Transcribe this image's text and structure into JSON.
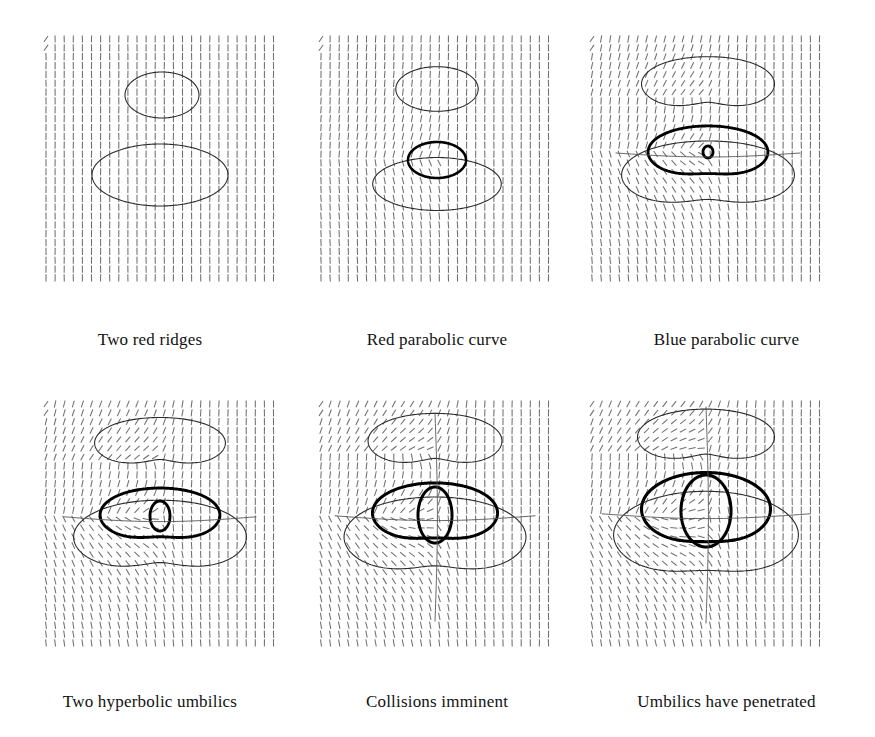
{
  "figure": {
    "background_color": "#ffffff",
    "ink_color": "#1a1a1a",
    "field_color": "#6f6f6f",
    "rows": 2,
    "cols": 3
  },
  "panels": [
    {
      "id": "panel-1",
      "caption": "Two red ridges",
      "row": 0,
      "col": 0,
      "field": {
        "type": "line-field",
        "nx": 26,
        "ny": 28,
        "dx": 9.1,
        "dy": 8.85,
        "x0": 6,
        "y0": 7,
        "tick_length": 7.2,
        "base_angle_deg": 90,
        "swirl_strength": 0.0,
        "centers": [],
        "corner_tilt_deg": 35
      },
      "curves": [
        {
          "name": "upper-red-ridge",
          "kind": "ellipse",
          "cx": 122,
          "cy": 63,
          "rx": 37,
          "ry": 23,
          "stroke": "#2b2b2b",
          "width": 1.1,
          "wobble": 0.0,
          "lobes": 0
        },
        {
          "name": "lower-red-ridge",
          "kind": "ellipse",
          "cx": 120,
          "cy": 143,
          "rx": 68,
          "ry": 31,
          "stroke": "#2b2b2b",
          "width": 1.1,
          "wobble": 0.0,
          "lobes": 0
        }
      ]
    },
    {
      "id": "panel-2",
      "caption": "Red parabolic curve",
      "row": 0,
      "col": 1,
      "field": {
        "type": "line-field",
        "nx": 26,
        "ny": 28,
        "dx": 9.1,
        "dy": 8.85,
        "x0": 6,
        "y0": 7,
        "tick_length": 7.2,
        "base_angle_deg": 90,
        "swirl_strength": 0.3,
        "centers": [
          {
            "x": 125,
            "y": 130,
            "weight": 1.0
          }
        ],
        "corner_tilt_deg": 35
      },
      "curves": [
        {
          "name": "upper-red-ridge",
          "kind": "ellipse",
          "cx": 122,
          "cy": 57,
          "rx": 40,
          "ry": 23,
          "stroke": "#2b2b2b",
          "width": 1.1,
          "wobble": 0.03,
          "lobes": 2
        },
        {
          "name": "lower-red-ridge",
          "kind": "ellipse",
          "cx": 122,
          "cy": 152,
          "rx": 63,
          "ry": 27,
          "stroke": "#2b2b2b",
          "width": 1.1,
          "wobble": 0.02,
          "lobes": 2
        },
        {
          "name": "blue-parabolic-curve",
          "kind": "ellipse",
          "cx": 122,
          "cy": 128,
          "rx": 29,
          "ry": 18,
          "stroke": "#000000",
          "width": 2.6,
          "wobble": 0.0,
          "lobes": 0
        }
      ]
    },
    {
      "id": "panel-3",
      "caption": "Blue parabolic curve",
      "row": 0,
      "col": 2,
      "field": {
        "type": "line-field",
        "nx": 26,
        "ny": 28,
        "dx": 9.1,
        "dy": 8.85,
        "x0": 6,
        "y0": 7,
        "tick_length": 7.2,
        "base_angle_deg": 90,
        "swirl_strength": 0.72,
        "centers": [
          {
            "x": 124,
            "y": 122,
            "weight": 1.0
          },
          {
            "x": 124,
            "y": 62,
            "weight": 0.45
          }
        ],
        "corner_tilt_deg": 35
      },
      "curves": [
        {
          "name": "upper-red-ridge",
          "kind": "blob",
          "cx": 122,
          "cy": 52,
          "rx": 61,
          "ry": 30,
          "stroke": "#2b2b2b",
          "width": 1.1,
          "wobble": 0.09,
          "lobes": 2,
          "notch": 0.3
        },
        {
          "name": "lower-red-ridge",
          "kind": "blob",
          "cx": 122,
          "cy": 143,
          "rx": 80,
          "ry": 37,
          "stroke": "#2b2b2b",
          "width": 1.1,
          "wobble": 0.08,
          "lobes": 2,
          "notch": 0.26
        },
        {
          "name": "blue-parabolic-curve",
          "kind": "blob",
          "cx": 122,
          "cy": 120,
          "rx": 56,
          "ry": 28,
          "stroke": "#000000",
          "width": 2.8,
          "wobble": 0.07,
          "lobes": 2,
          "notch": 0.16
        },
        {
          "name": "umbilic-pair",
          "kind": "ellipse",
          "cx": 122,
          "cy": 120,
          "rx": 5,
          "ry": 6,
          "stroke": "#000000",
          "width": 2.8,
          "wobble": 0.0,
          "lobes": 0
        },
        {
          "name": "horizontal-separatrix",
          "kind": "hline",
          "cx": 122,
          "cy": 122,
          "rx": 92,
          "ry": 5,
          "stroke": "#555555",
          "width": 0.9
        }
      ]
    },
    {
      "id": "panel-4",
      "caption": "Two hyperbolic umbilics",
      "row": 1,
      "col": 0,
      "field": {
        "type": "line-field",
        "nx": 26,
        "ny": 28,
        "dx": 9.1,
        "dy": 8.85,
        "x0": 6,
        "y0": 7,
        "tick_length": 7.2,
        "base_angle_deg": 90,
        "swirl_strength": 0.95,
        "centers": [
          {
            "x": 122,
            "y": 122,
            "weight": 1.0
          },
          {
            "x": 122,
            "y": 62,
            "weight": 0.5
          }
        ],
        "corner_tilt_deg": 35
      },
      "curves": [
        {
          "name": "upper-red-ridge",
          "kind": "blob",
          "cx": 120,
          "cy": 46,
          "rx": 60,
          "ry": 28,
          "stroke": "#2b2b2b",
          "width": 1.1,
          "wobble": 0.09,
          "lobes": 2,
          "notch": 0.32
        },
        {
          "name": "lower-red-ridge",
          "kind": "blob",
          "cx": 120,
          "cy": 140,
          "rx": 80,
          "ry": 40,
          "stroke": "#2b2b2b",
          "width": 1.1,
          "wobble": 0.08,
          "lobes": 2,
          "notch": 0.28
        },
        {
          "name": "blue-parabolic-curve",
          "kind": "blob",
          "cx": 120,
          "cy": 118,
          "rx": 56,
          "ry": 29,
          "stroke": "#000000",
          "width": 2.9,
          "wobble": 0.07,
          "lobes": 2,
          "notch": 0.18
        },
        {
          "name": "umbilic-pair",
          "kind": "ellipse",
          "cx": 120,
          "cy": 119,
          "rx": 10,
          "ry": 15,
          "stroke": "#000000",
          "width": 2.9,
          "wobble": 0.0,
          "lobes": 0
        },
        {
          "name": "horizontal-separatrix",
          "kind": "hline",
          "cx": 120,
          "cy": 121,
          "rx": 96,
          "ry": 6,
          "stroke": "#555555",
          "width": 0.9
        }
      ]
    },
    {
      "id": "panel-5",
      "caption": "Collisions imminent",
      "row": 1,
      "col": 1,
      "field": {
        "type": "line-field",
        "nx": 26,
        "ny": 28,
        "dx": 9.1,
        "dy": 8.85,
        "x0": 6,
        "y0": 7,
        "tick_length": 7.2,
        "base_angle_deg": 90,
        "swirl_strength": 1.12,
        "centers": [
          {
            "x": 122,
            "y": 122,
            "weight": 1.0
          },
          {
            "x": 122,
            "y": 56,
            "weight": 0.55
          }
        ],
        "corner_tilt_deg": 35
      },
      "curves": [
        {
          "name": "upper-red-ridge",
          "kind": "blob",
          "cx": 120,
          "cy": 44,
          "rx": 62,
          "ry": 30,
          "stroke": "#2b2b2b",
          "width": 1.1,
          "wobble": 0.08,
          "lobes": 2,
          "notch": 0.34
        },
        {
          "name": "lower-red-ridge",
          "kind": "blob",
          "cx": 120,
          "cy": 140,
          "rx": 85,
          "ry": 43,
          "stroke": "#2b2b2b",
          "width": 1.1,
          "wobble": 0.07,
          "lobes": 2,
          "notch": 0.26
        },
        {
          "name": "blue-parabolic-curve",
          "kind": "blob",
          "cx": 120,
          "cy": 116,
          "rx": 59,
          "ry": 32,
          "stroke": "#000000",
          "width": 3.0,
          "wobble": 0.06,
          "lobes": 2,
          "notch": 0.16
        },
        {
          "name": "umbilic-pair",
          "kind": "ellipse",
          "cx": 120,
          "cy": 118,
          "rx": 17,
          "ry": 28,
          "stroke": "#000000",
          "width": 3.0,
          "wobble": 0.0,
          "lobes": 0
        },
        {
          "name": "horizontal-separatrix",
          "kind": "hline",
          "cx": 120,
          "cy": 120,
          "rx": 100,
          "ry": 6,
          "stroke": "#555555",
          "width": 0.9
        },
        {
          "name": "vertical-separatrix",
          "kind": "vline",
          "cx": 120,
          "cy": 120,
          "rx": 6,
          "ry": 104,
          "stroke": "#555555",
          "width": 0.9
        }
      ]
    },
    {
      "id": "panel-6",
      "caption": "Umbilics have penetrated",
      "row": 1,
      "col": 2,
      "field": {
        "type": "line-field",
        "nx": 26,
        "ny": 28,
        "dx": 9.1,
        "dy": 8.85,
        "x0": 6,
        "y0": 7,
        "tick_length": 7.2,
        "base_angle_deg": 90,
        "swirl_strength": 1.3,
        "centers": [
          {
            "x": 122,
            "y": 122,
            "weight": 1.0
          },
          {
            "x": 122,
            "y": 52,
            "weight": 0.6
          }
        ],
        "corner_tilt_deg": 35
      },
      "curves": [
        {
          "name": "upper-red-ridge",
          "kind": "blob",
          "cx": 120,
          "cy": 40,
          "rx": 64,
          "ry": 30,
          "stroke": "#2b2b2b",
          "width": 1.1,
          "wobble": 0.07,
          "lobes": 2,
          "notch": 0.36
        },
        {
          "name": "lower-red-ridge",
          "kind": "blob",
          "cx": 120,
          "cy": 138,
          "rx": 88,
          "ry": 46,
          "stroke": "#2b2b2b",
          "width": 1.1,
          "wobble": 0.05,
          "lobes": 2,
          "notch": 0.18
        },
        {
          "name": "blue-parabolic-curve",
          "kind": "blob",
          "cx": 120,
          "cy": 112,
          "rx": 62,
          "ry": 38,
          "stroke": "#000000",
          "width": 3.1,
          "wobble": 0.04,
          "lobes": 2,
          "notch": 0.1
        },
        {
          "name": "umbilic-pair",
          "kind": "ellipse",
          "cx": 120,
          "cy": 114,
          "rx": 25,
          "ry": 36,
          "stroke": "#000000",
          "width": 3.1,
          "wobble": 0.0,
          "lobes": 0
        },
        {
          "name": "horizontal-separatrix",
          "kind": "hline",
          "cx": 120,
          "cy": 118,
          "rx": 104,
          "ry": 6,
          "stroke": "#555555",
          "width": 0.9
        },
        {
          "name": "vertical-separatrix",
          "kind": "vline",
          "cx": 120,
          "cy": 118,
          "rx": 6,
          "ry": 108,
          "stroke": "#555555",
          "width": 0.9
        }
      ]
    }
  ],
  "captions": {
    "row0": [
      "Two red ridges",
      "Red parabolic curve",
      "Blue parabolic curve"
    ],
    "row1": [
      "Two hyperbolic umbilics",
      "Collisions imminent",
      "Umbilics have penetrated"
    ]
  }
}
